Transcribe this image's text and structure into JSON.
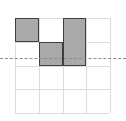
{
  "figure": {
    "width": 126,
    "height": 121,
    "background_color": "#ffffff"
  },
  "chart_data": {
    "type": "heatmap",
    "title": "",
    "subtitle": "",
    "xlabel": "",
    "ylabel": "",
    "grid": true,
    "legend_position": "none",
    "grid_spec": {
      "columns": 4,
      "rows": 4,
      "cell_size_px": 23.75,
      "origin_x_px": 15,
      "origin_y_px": 18,
      "line_color": "#dcdcdc",
      "column_tick_labels": [
        "",
        "",
        "",
        ""
      ],
      "row_tick_labels": [
        "",
        "",
        "",
        ""
      ]
    },
    "axis_line": {
      "orientation": "horizontal",
      "style": "dashed",
      "color": "#8c8c8c",
      "y_px": 58,
      "row_boundary_index": 1,
      "spans_full_width": true
    },
    "cells": [
      {
        "name": "block-a",
        "column": 1,
        "row": 1,
        "col_span": 1,
        "row_span": 1,
        "fill": "#a9a9a9",
        "stroke": "#3f3f3f"
      },
      {
        "name": "block-b",
        "column": 3,
        "row": 1,
        "col_span": 1,
        "row_span": 2,
        "fill": "#a9a9a9",
        "stroke": "#3f3f3f"
      },
      {
        "name": "block-c",
        "column": 2,
        "row": 2,
        "col_span": 1,
        "row_span": 1,
        "fill": "#a9a9a9",
        "stroke": "#3f3f3f"
      }
    ],
    "categories": [
      "col-1",
      "col-2",
      "col-3",
      "col-4"
    ],
    "values": [
      [
        1,
        0,
        1,
        0
      ],
      [
        0,
        1,
        1,
        0
      ],
      [
        0,
        0,
        0,
        0
      ],
      [
        0,
        0,
        0,
        0
      ]
    ]
  }
}
